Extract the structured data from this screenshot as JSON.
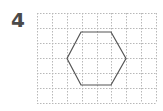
{
  "problem": {
    "number": "4"
  },
  "grid": {
    "columns": 8,
    "rows": 6,
    "x0": 37,
    "y0": 13,
    "cell_w": 14.875,
    "cell_h": 15,
    "line_color": "#b8b8b8",
    "dash": "1.5,1.5"
  },
  "shape": {
    "type": "hexagon",
    "stroke": "#555555",
    "points": [
      [
        81,
        32
      ],
      [
        111,
        32
      ],
      [
        126,
        58.5
      ],
      [
        111,
        85
      ],
      [
        81,
        85
      ],
      [
        67,
        58.5
      ]
    ]
  }
}
